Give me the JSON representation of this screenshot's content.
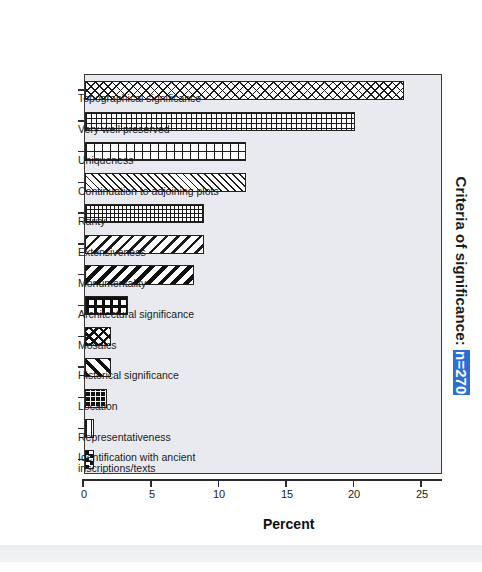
{
  "chart": {
    "title_prefix": "Criteria of significance: ",
    "title_n": "n=270",
    "axis_title": "Percent",
    "n_badge_color": "#2b6fd6"
  },
  "chart_data": {
    "type": "bar",
    "title": "Criteria of significance: n=270",
    "xlabel": "",
    "ylabel": "Percent",
    "ylim": [
      0,
      26.5
    ],
    "yticks": [
      0,
      5,
      10,
      15,
      20,
      25
    ],
    "grid": false,
    "legend": null,
    "orientation": "vertical-bars-page-rotated-90",
    "n": 270,
    "categories": [
      "Topographical significance",
      "Very well preserved",
      "Uniqueness",
      "Continuation to adjoining plots",
      "Rarity",
      "Extensiveness",
      "Monumentality",
      "Architectural significance",
      "Mosaics",
      "Historical significance",
      "Location",
      "Representativeness",
      "Identification with ancient inscriptions/texts"
    ],
    "values": [
      23.6,
      20.0,
      11.9,
      11.9,
      8.8,
      8.8,
      8.1,
      3.2,
      1.9,
      1.9,
      1.6,
      0.7,
      0.7
    ],
    "patterns": [
      "crosshatch",
      "grid",
      "plus",
      "diag-right",
      "fine-grid",
      "diag-left",
      "diag-left-bold",
      "bold-grid",
      "crosshatch-bold",
      "diag-right-bold",
      "dots",
      "hlines",
      "checker"
    ]
  },
  "ticklabels": {
    "t0": "0",
    "t5": "5",
    "t10": "10",
    "t15": "15",
    "t20": "20",
    "t25": "25"
  },
  "categories_display": [
    {
      "line1": "Topographical significance",
      "line2": ""
    },
    {
      "line1": "Very well preserved",
      "line2": ""
    },
    {
      "line1": "Uniqueness",
      "line2": ""
    },
    {
      "line1": "Continuation to adjoining plots",
      "line2": ""
    },
    {
      "line1": "Rarity",
      "line2": ""
    },
    {
      "line1": "Extensiveness",
      "line2": ""
    },
    {
      "line1": "Monumentality",
      "line2": ""
    },
    {
      "line1": "Architectural significance",
      "line2": ""
    },
    {
      "line1": "Mosaics",
      "line2": ""
    },
    {
      "line1": "Historical significance",
      "line2": ""
    },
    {
      "line1": "Location",
      "line2": ""
    },
    {
      "line1": "Representativeness",
      "line2": ""
    },
    {
      "line1": "Identification with ancient",
      "line2": "inscriptions/texts"
    }
  ]
}
